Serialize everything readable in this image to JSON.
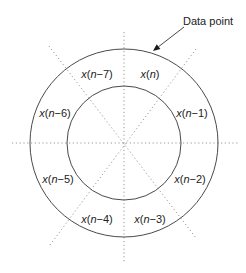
{
  "diagram": {
    "center": {
      "x": 124,
      "y": 143
    },
    "outer_radius": 94,
    "inner_radius": 57,
    "colors": {
      "circle": "#4a4a4a",
      "divider": "#8c8c8c",
      "text": "#222222",
      "background": "#ffffff"
    },
    "callout": {
      "label": "Data point",
      "label_pos": {
        "x": 183,
        "y": 25
      },
      "arrow_from": {
        "x": 184,
        "y": 27
      },
      "arrow_to": {
        "x": 153,
        "y": 51
      }
    },
    "dividers": [
      {
        "name": "vertical",
        "x1": 124,
        "y1": 32,
        "x2": 124,
        "y2": 262
      },
      {
        "name": "horizontal",
        "x1": 12,
        "y1": 143,
        "x2": 238,
        "y2": 143
      },
      {
        "name": "diagonal-nw-se",
        "x1": 49,
        "y1": 46,
        "x2": 196,
        "y2": 238
      },
      {
        "name": "diagonal-ne-sw",
        "x1": 196,
        "y1": 49,
        "x2": 50,
        "y2": 245
      }
    ],
    "samples": [
      {
        "label": "x(n)",
        "var": "x",
        "index": "n",
        "x": 150,
        "y": 74
      },
      {
        "label": "x(n−1)",
        "var": "x",
        "index": "n−1",
        "x": 192,
        "y": 113
      },
      {
        "label": "x(n−2)",
        "var": "x",
        "index": "n−2",
        "x": 190,
        "y": 179
      },
      {
        "label": "x(n−3)",
        "var": "x",
        "index": "n−3",
        "x": 150,
        "y": 219
      },
      {
        "label": "x(n−4)",
        "var": "x",
        "index": "n−4",
        "x": 97,
        "y": 219
      },
      {
        "label": "x(n−5)",
        "var": "x",
        "index": "n−5",
        "x": 58,
        "y": 179
      },
      {
        "label": "x(n−6)",
        "var": "x",
        "index": "n−6",
        "x": 55,
        "y": 113
      },
      {
        "label": "x(n−7)",
        "var": "x",
        "index": "n−7",
        "x": 97,
        "y": 74
      }
    ]
  }
}
